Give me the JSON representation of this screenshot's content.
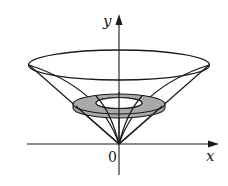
{
  "figure": {
    "axes": {
      "x_label": "x",
      "y_label": "y",
      "origin_label": "0"
    },
    "colors": {
      "line": "#1a1a1a",
      "washer_fill": "#a9a9a9",
      "background": "#ffffff"
    },
    "elements": [
      "top-ellipse",
      "outer-cone-lines",
      "inner-curved-surface",
      "shaded-washer",
      "washer-hole"
    ]
  }
}
